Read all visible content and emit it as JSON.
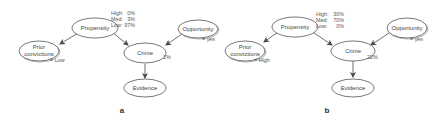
{
  "panels": [
    {
      "label": "a",
      "nodes": {
        "propensity": "Propensity",
        "prior_line1": "Prior",
        "prior_line2": "convictions",
        "opportunity": "Opportunity",
        "crime": "Crime",
        "evidence": "Evidence"
      },
      "observations": {
        "prior_convictions": "= Low",
        "opportunity": "= yes"
      },
      "propensity_distribution": [
        {
          "state": "High:",
          "value": "0%"
        },
        {
          "state": "Med:",
          "value": "3%"
        },
        {
          "state": "Low:",
          "value": "97%"
        }
      ],
      "crime_probability": "1%"
    },
    {
      "label": "b",
      "nodes": {
        "propensity": "Propensity",
        "prior_line1": "Prior",
        "prior_line2": "convictions",
        "opportunity": "Opportunity",
        "crime": "Crime",
        "evidence": "Evidence"
      },
      "observations": {
        "prior_convictions": "= High",
        "opportunity": "= yes"
      },
      "propensity_distribution": [
        {
          "state": "High:",
          "value": "30%"
        },
        {
          "state": "Med:",
          "value": "70%"
        },
        {
          "state": "Low:",
          "value": "0%"
        }
      ],
      "crime_probability": "22%"
    }
  ],
  "edges": [
    {
      "from": "propensity",
      "to": "prior_convictions"
    },
    {
      "from": "propensity",
      "to": "crime"
    },
    {
      "from": "opportunity",
      "to": "crime"
    },
    {
      "from": "crime",
      "to": "evidence"
    }
  ]
}
